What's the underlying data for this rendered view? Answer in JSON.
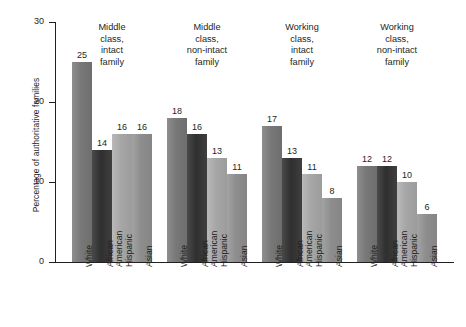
{
  "chart_data": {
    "type": "bar",
    "title": "",
    "xlabel": "",
    "ylabel": "Percentage of authoritative families",
    "ylim": [
      0,
      30
    ],
    "yticks": [
      0,
      10,
      20,
      30
    ],
    "grid": false,
    "legend": "none",
    "categories": [
      "White",
      "African American",
      "Hispanic",
      "Asian"
    ],
    "groups": [
      {
        "label": "Middle class, intact family",
        "label_lines": [
          "Middle",
          "class,",
          "intact",
          "family"
        ],
        "values": [
          25,
          14,
          16,
          16
        ]
      },
      {
        "label": "Middle class, non-intact family",
        "label_lines": [
          "Middle",
          "class,",
          "non-intact",
          "family"
        ],
        "values": [
          18,
          16,
          13,
          11
        ]
      },
      {
        "label": "Working class, intact family",
        "label_lines": [
          "Working",
          "class,",
          "intact",
          "family"
        ],
        "values": [
          17,
          13,
          11,
          8
        ]
      },
      {
        "label": "Working class, non-intact family",
        "label_lines": [
          "Working",
          "class,",
          "non-intact",
          "family"
        ],
        "values": [
          12,
          12,
          10,
          6
        ]
      }
    ],
    "series": [
      {
        "name": "White",
        "values": [
          25,
          18,
          17,
          12
        ],
        "color": "#787878"
      },
      {
        "name": "African American",
        "values": [
          14,
          16,
          13,
          12
        ],
        "color": "#2f2f2f"
      },
      {
        "name": "Hispanic",
        "values": [
          16,
          13,
          11,
          10
        ],
        "color": "#a6a6a6"
      },
      {
        "name": "Asian",
        "values": [
          16,
          11,
          8,
          6
        ],
        "color": "#8d8d8d"
      }
    ],
    "colors": {
      "axis": "#231f20",
      "text": "#231f20",
      "background": "#ffffff"
    }
  },
  "axis": {
    "y_tick_labels": [
      "0",
      "10",
      "20",
      "30"
    ],
    "y_title": "Percentage of authoritative families"
  },
  "x_tick_labels": {
    "white": "White",
    "african": "African",
    "american": "American",
    "hispanic": "Hispanic",
    "asian": "Asian"
  }
}
